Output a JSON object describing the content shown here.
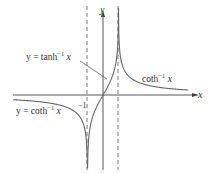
{
  "figure": {
    "axes": {
      "x_label": "x",
      "y_label": "y"
    },
    "asymptotes": {
      "left_label": "−1",
      "left_value": -1,
      "right_value": 1
    },
    "labels": {
      "tanh_inverse": {
        "prefix": "y = tanh",
        "sup": "−1",
        "var": " x"
      },
      "coth_inverse_right": {
        "prefix": "coth",
        "sup": "−1",
        "var": " x"
      },
      "coth_inverse_left": {
        "prefix": "y = coth",
        "sup": "−1",
        "var": " x"
      }
    },
    "colors": {
      "axis": "#444444",
      "curve": "#666666",
      "dashed": "#555555",
      "text": "#333333"
    }
  },
  "chart_data": {
    "type": "line",
    "title": "",
    "xlabel": "x",
    "ylabel": "y",
    "series": [
      {
        "name": "y = tanh^-1 x",
        "domain": [
          -1,
          1
        ],
        "function": "atanh(x)"
      },
      {
        "name": "coth^-1 x (x > 1)",
        "domain": [
          1,
          5.5
        ],
        "function": "acoth(x)"
      },
      {
        "name": "y = coth^-1 x (x < -1)",
        "domain": [
          -5.8,
          -1
        ],
        "function": "acoth(x)"
      }
    ],
    "asymptotes": {
      "vertical": [
        -1,
        1
      ],
      "horizontal": [
        0
      ]
    },
    "annotations": [
      "-1"
    ],
    "grid": false
  }
}
